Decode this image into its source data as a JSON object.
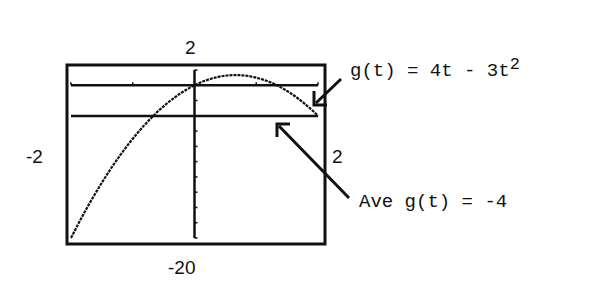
{
  "chart_data": {
    "type": "line",
    "title": "",
    "xlabel": "t",
    "ylabel": "g(t)",
    "xlim": [
      -2,
      2
    ],
    "ylim": [
      -20,
      2
    ],
    "x_tick_step": 1,
    "y_tick_step": 2,
    "window_labels": {
      "xmin": "-2",
      "xmax": "2",
      "ymin": "-20",
      "ymax": "2"
    },
    "series": [
      {
        "name": "g(t) = 4t - 3t^2",
        "x": [
          -2,
          -1.5,
          -1,
          -0.5,
          0,
          0.5,
          0.6667,
          1,
          1.5,
          2
        ],
        "y": [
          -20,
          -12.75,
          -7,
          -2.75,
          0,
          1.25,
          1.3333,
          1,
          -0.75,
          -4
        ]
      },
      {
        "name": "Ave g(t) = -4",
        "x": [
          -2,
          2
        ],
        "y": [
          -4,
          -4
        ]
      }
    ],
    "annotations": [
      {
        "text": "g(t) = 4t - 3t",
        "superscript": "2",
        "points_to": "curve near t=2"
      },
      {
        "text": "Ave g(t) = -4",
        "points_to": "horizontal line y=-4"
      }
    ],
    "grid": false,
    "legend": "none"
  },
  "labels": {
    "ymax": "2",
    "ymin": "-20",
    "xmin": "-2",
    "xmax": "2",
    "func_text": "g(t) = 4t - 3t",
    "func_sup": "2",
    "ave_text": "Ave g(t) = -4"
  },
  "colors": {
    "ink": "#111111",
    "background": "#ffffff"
  }
}
